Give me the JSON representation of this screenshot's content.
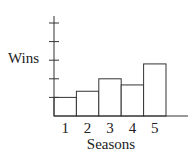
{
  "chart_data": {
    "type": "bar",
    "title": "",
    "xlabel": "Seasons",
    "ylabel": "Wins",
    "categories": [
      "1",
      "2",
      "3",
      "4",
      "5"
    ],
    "values": [
      1,
      1.33,
      2,
      1.67,
      2.8
    ],
    "ylim": [
      0,
      5
    ],
    "y_ticks": 5,
    "y_tick_labels": [],
    "grid": false,
    "legend": null
  }
}
